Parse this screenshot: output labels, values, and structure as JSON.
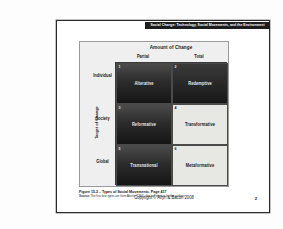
{
  "slide": {
    "header_title": "Social Change:  Technology, Social Movements, and the Environment",
    "footer_copyright": "Copyright © Allyn & Bacon 2008",
    "footer_page": "2"
  },
  "figure": {
    "matrix_title": "Amount of Change",
    "row_axis_label": "Target of Change",
    "columns": [
      {
        "label": "Partial"
      },
      {
        "label": "Total"
      }
    ],
    "rows": [
      {
        "label": "Individual"
      },
      {
        "label": "Society"
      },
      {
        "label": "Global"
      }
    ],
    "cells": [
      {
        "number": "1",
        "label": "Alterative",
        "tone": "dark"
      },
      {
        "number": "2",
        "label": "Redemptive",
        "tone": "dark"
      },
      {
        "number": "3",
        "label": "Reformative",
        "tone": "dark"
      },
      {
        "number": "4",
        "label": "Transformative",
        "tone": "light"
      },
      {
        "number": "5",
        "label": "Transnational",
        "tone": "dark"
      },
      {
        "number": "6",
        "label": "Metaformative",
        "tone": "light"
      }
    ],
    "caption": "Figure 15.2 – Types of Social Movements.  Page 417",
    "source_label": "Source:",
    "source_text": "The first four types are from Aberle (1966), the last two are by the authors."
  },
  "colors": {
    "header_bar": "#1d1d1d",
    "dark_cell": "#2c2c2c",
    "light_cell": "#e7e7e4",
    "figure_bg": "#efefef",
    "slide_border": "#2b2b2b"
  }
}
